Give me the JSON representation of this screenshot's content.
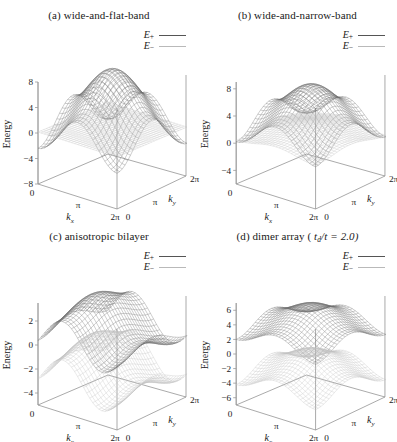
{
  "figure": {
    "panels": [
      {
        "id": "a",
        "title_prefix": "(a)",
        "title": "wide-and-flat-band",
        "legend": {
          "upper": "E",
          "upper_sub": "+",
          "lower": "E",
          "lower_sub": "−"
        },
        "ylabel": "Energy",
        "yticks": [
          "8",
          "4",
          "0",
          "-4",
          "-8"
        ],
        "xlabel": "k",
        "xlabel_sub": "x",
        "xticks": [
          "0",
          "π",
          "2π"
        ],
        "zlabel": "k",
        "zlabel_sub": "y",
        "zticks": [
          "0",
          "π",
          "2π"
        ]
      },
      {
        "id": "b",
        "title_prefix": "(b)",
        "title": "wide-and-narrow-band",
        "legend": {
          "upper": "E",
          "upper_sub": "+",
          "lower": "E",
          "lower_sub": "−"
        },
        "ylabel": "Energy",
        "yticks": [
          "8",
          "4",
          "0",
          "-4"
        ],
        "xlabel": "k",
        "xlabel_sub": "x",
        "xticks": [
          "0",
          "π",
          "2π"
        ],
        "zlabel": "k",
        "zlabel_sub": "y",
        "zticks": [
          "0",
          "π",
          "2π"
        ]
      },
      {
        "id": "c",
        "title_prefix": "(c)",
        "title": "anisotropic bilayer",
        "legend": {
          "upper": "E",
          "upper_sub": "+",
          "lower": "E",
          "lower_sub": "−"
        },
        "ylabel": "Energy",
        "yticks": [
          "2",
          "0",
          "-2",
          "-4"
        ],
        "xlabel": "k",
        "xlabel_sub": "x",
        "xticks": [
          "0",
          "π",
          "2π"
        ],
        "zlabel": "k",
        "zlabel_sub": "y",
        "zticks": [
          "0",
          "π",
          "2π"
        ]
      },
      {
        "id": "d",
        "title_prefix": "(d)",
        "title": "dimer array (",
        "title_param_var": "t",
        "title_param_sub": "d",
        "title_param_rest": "/t = 2.0)",
        "legend": {
          "upper": "E",
          "upper_sub": "+",
          "lower": "E",
          "lower_sub": "−"
        },
        "ylabel": "Energy",
        "yticks": [
          "6",
          "4",
          "2",
          "0",
          "-2",
          "-4",
          "-6"
        ],
        "xlabel": "k",
        "xlabel_sub": "x",
        "xticks": [
          "0",
          "π",
          "2π"
        ],
        "zlabel": "k",
        "zlabel_sub": "y",
        "zticks": [
          "0",
          "π",
          "2π"
        ]
      }
    ]
  },
  "chart_data": [
    {
      "type": "line",
      "panel": "a",
      "title": "(a) wide-and-flat-band",
      "xlabel": "k_x",
      "ylabel": "Energy",
      "zlabel": "k_y",
      "xlim": [
        0,
        6.283185
      ],
      "zlim": [
        0,
        6.283185
      ],
      "ylim": [
        -8,
        8
      ],
      "yticks": [
        8,
        4,
        0,
        -4,
        -8
      ],
      "xticks": [
        0,
        3.141593,
        6.283185
      ],
      "xticklabels": [
        "0",
        "π",
        "2π"
      ],
      "zticks": [
        0,
        3.141593,
        6.283185
      ],
      "zticklabels": [
        "0",
        "π",
        "2π"
      ],
      "grid": false,
      "legend_position": "top-right",
      "series": [
        {
          "name": "E+",
          "color": "#6e6e6e",
          "description": "wide dispersive upper band, saddle-shaped, max ~8 at zone corners, min ~-4 at center"
        },
        {
          "name": "E-",
          "color": "#c2c2c2",
          "description": "flat band, nearly constant ~0 across the whole Brillouin zone"
        }
      ]
    },
    {
      "type": "line",
      "panel": "b",
      "title": "(b) wide-and-narrow-band",
      "xlabel": "k_x",
      "ylabel": "Energy",
      "zlabel": "k_y",
      "xlim": [
        0,
        6.283185
      ],
      "zlim": [
        0,
        6.283185
      ],
      "ylim": [
        -6,
        9
      ],
      "yticks": [
        8,
        4,
        0,
        -4
      ],
      "xticks": [
        0,
        3.141593,
        6.283185
      ],
      "xticklabels": [
        "0",
        "π",
        "2π"
      ],
      "zticks": [
        0,
        3.141593,
        6.283185
      ],
      "zticklabels": [
        "0",
        "π",
        "2π"
      ],
      "grid": false,
      "legend_position": "top-right",
      "series": [
        {
          "name": "E+",
          "color": "#6e6e6e",
          "description": "wide band, maxima ~8 at zone corners, dipping to ~0 near center"
        },
        {
          "name": "E-",
          "color": "#c2c2c2",
          "description": "narrow band with small dispersion around ~0 to 2"
        }
      ]
    },
    {
      "type": "line",
      "panel": "c",
      "title": "(c) anisotropic bilayer",
      "xlabel": "k_x",
      "ylabel": "Energy",
      "zlabel": "k_y",
      "xlim": [
        0,
        6.283185
      ],
      "zlim": [
        0,
        6.283185
      ],
      "ylim": [
        -5,
        3.5
      ],
      "yticks": [
        2,
        0,
        -2,
        -4
      ],
      "xticks": [
        0,
        3.141593,
        6.283185
      ],
      "xticklabels": [
        "0",
        "π",
        "2π"
      ],
      "zticks": [
        0,
        3.141593,
        6.283185
      ],
      "zticklabels": [
        "0",
        "π",
        "2π"
      ],
      "grid": false,
      "legend_position": "top-right",
      "series": [
        {
          "name": "E+",
          "color": "#6e6e6e",
          "description": "upper band, broad ridge peaking ~3 along one direction, anisotropic"
        },
        {
          "name": "E-",
          "color": "#c2c2c2",
          "description": "lower band, minimum ~-4, anisotropic along k_x"
        }
      ]
    },
    {
      "type": "line",
      "panel": "d",
      "title": "(d) dimer array ( t_d/t = 2.0)",
      "xlabel": "k_x",
      "ylabel": "Energy",
      "zlabel": "k_y",
      "xlim": [
        0,
        6.283185
      ],
      "zlim": [
        0,
        6.283185
      ],
      "ylim": [
        -7,
        7
      ],
      "yticks": [
        6,
        4,
        2,
        0,
        -2,
        -4,
        -6
      ],
      "xticks": [
        0,
        3.141593,
        6.283185
      ],
      "xticklabels": [
        "0",
        "π",
        "2π"
      ],
      "zticks": [
        0,
        3.141593,
        6.283185
      ],
      "zticklabels": [
        "0",
        "π",
        "2π"
      ],
      "grid": false,
      "legend_position": "top-right",
      "parameters": {
        "t_d/t": 2.0
      },
      "series": [
        {
          "name": "E+",
          "color": "#6e6e6e",
          "description": "upper dimer band, maxima ~6 at zone corners, min ~2 at center"
        },
        {
          "name": "E-",
          "color": "#c2c2c2",
          "description": "lower dimer band, minima ~-6, split from E+ by dimerization 2t_d"
        }
      ]
    }
  ]
}
